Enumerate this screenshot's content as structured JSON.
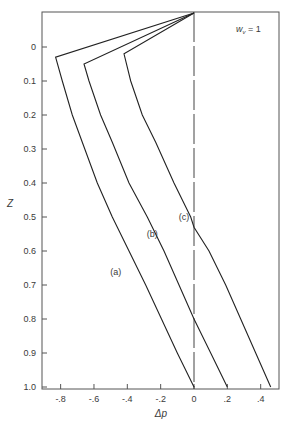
{
  "chart_data": {
    "type": "line",
    "title": "",
    "xlabel": "Δp",
    "ylabel": "Z",
    "annotation": {
      "text_main": "w",
      "text_sub": "v",
      "text_tail": " = 1"
    },
    "xlim": [
      -0.9,
      0.52
    ],
    "ylim": [
      -0.104,
      1.0
    ],
    "y_inverted": true,
    "grid": false,
    "legend": "none (inline labels)",
    "x_ticks": [
      {
        "value": -0.8,
        "label": "-.8"
      },
      {
        "value": -0.6,
        "label": "-.6"
      },
      {
        "value": -0.4,
        "label": "-.4"
      },
      {
        "value": -0.2,
        "label": "-.2"
      },
      {
        "value": 0,
        "label": "0"
      },
      {
        "value": 0.2,
        "label": ".2"
      },
      {
        "value": 0.4,
        "label": ".4"
      }
    ],
    "y_ticks": [
      {
        "value": 0,
        "label": "0"
      },
      {
        "value": 0.1,
        "label": "0.1"
      },
      {
        "value": 0.2,
        "label": "0.2"
      },
      {
        "value": 0.3,
        "label": "0.3"
      },
      {
        "value": 0.4,
        "label": "0.4"
      },
      {
        "value": 0.5,
        "label": "0.5"
      },
      {
        "value": 0.6,
        "label": "0.6"
      },
      {
        "value": 0.7,
        "label": "0.7"
      },
      {
        "value": 0.8,
        "label": "0.8"
      },
      {
        "value": 0.9,
        "label": "0.9"
      },
      {
        "value": 1.0,
        "label": "1.0"
      }
    ],
    "reference_line": {
      "type": "vertical-dashed",
      "x": 0
    },
    "series": [
      {
        "name": "(a)",
        "label_pos": {
          "dp": -0.47,
          "z": 0.67
        },
        "points": [
          {
            "dp": 0.0,
            "z": -0.1
          },
          {
            "dp": -0.83,
            "z": 0.03
          },
          {
            "dp": -0.79,
            "z": 0.1
          },
          {
            "dp": -0.73,
            "z": 0.2
          },
          {
            "dp": -0.67,
            "z": 0.28
          },
          {
            "dp": -0.58,
            "z": 0.4
          },
          {
            "dp": -0.49,
            "z": 0.5
          },
          {
            "dp": -0.39,
            "z": 0.6
          },
          {
            "dp": -0.29,
            "z": 0.7
          },
          {
            "dp": -0.195,
            "z": 0.8
          },
          {
            "dp": -0.1,
            "z": 0.9
          },
          {
            "dp": 0.0,
            "z": 1.0
          }
        ]
      },
      {
        "name": "(b)",
        "label_pos": {
          "dp": -0.25,
          "z": 0.56
        },
        "points": [
          {
            "dp": 0.0,
            "z": -0.1
          },
          {
            "dp": -0.66,
            "z": 0.05
          },
          {
            "dp": -0.63,
            "z": 0.1
          },
          {
            "dp": -0.56,
            "z": 0.2
          },
          {
            "dp": -0.49,
            "z": 0.28
          },
          {
            "dp": -0.39,
            "z": 0.4
          },
          {
            "dp": -0.28,
            "z": 0.5
          },
          {
            "dp": -0.18,
            "z": 0.6
          },
          {
            "dp": -0.09,
            "z": 0.7
          },
          {
            "dp": 0.0,
            "z": 0.8
          },
          {
            "dp": 0.1,
            "z": 0.9
          },
          {
            "dp": 0.2,
            "z": 1.0
          }
        ]
      },
      {
        "name": "(c)",
        "label_pos": {
          "dp": -0.06,
          "z": 0.51
        },
        "points": [
          {
            "dp": 0.0,
            "z": -0.1
          },
          {
            "dp": -0.42,
            "z": 0.02
          },
          {
            "dp": -0.38,
            "z": 0.1
          },
          {
            "dp": -0.31,
            "z": 0.2
          },
          {
            "dp": -0.23,
            "z": 0.28
          },
          {
            "dp": -0.12,
            "z": 0.4
          },
          {
            "dp": -0.02,
            "z": 0.5
          },
          {
            "dp": 0.0,
            "z": 0.53
          },
          {
            "dp": 0.09,
            "z": 0.6
          },
          {
            "dp": 0.19,
            "z": 0.7
          },
          {
            "dp": 0.28,
            "z": 0.8
          },
          {
            "dp": 0.37,
            "z": 0.9
          },
          {
            "dp": 0.46,
            "z": 1.0
          }
        ]
      }
    ]
  }
}
